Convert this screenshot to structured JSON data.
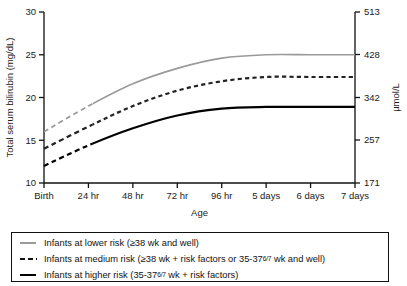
{
  "chart_data": {
    "type": "line",
    "title": "",
    "xlabel": "Age",
    "ylabel": "Total serum bilirubin (mg/dL)",
    "ylabel_right": "µmol/L",
    "grid": false,
    "legend_position": "bottom",
    "categories": [
      "Birth",
      "24 hr",
      "48 hr",
      "72 hr",
      "96 hr",
      "5 days",
      "6 days",
      "7 days"
    ],
    "x": [
      0,
      1,
      2,
      3,
      4,
      5,
      6,
      7
    ],
    "ylim": [
      10,
      30
    ],
    "yticks": [
      10,
      15,
      20,
      25,
      30
    ],
    "ytick_labels": [
      "10",
      "15",
      "20",
      "25",
      "30"
    ],
    "ylim_right": [
      171,
      513
    ],
    "yticks_right": [
      171,
      257,
      342,
      428,
      513
    ],
    "ytick_labels_right": [
      "171",
      "257",
      "342",
      "428",
      "513"
    ],
    "series": [
      {
        "name": "Infants at lower risk (≥38 wk and well)",
        "color": "#9a9a9a",
        "style": "solid",
        "lead_style": "dashed",
        "lead_end_x": 1.1,
        "values": [
          16.0,
          19.0,
          21.6,
          23.4,
          24.6,
          25.0,
          25.0,
          25.0
        ]
      },
      {
        "name": "Infants at medium risk (≥38 wk + risk factors or 35-37 6/7 wk and well)",
        "color": "#222222",
        "style": "dashed",
        "lead_style": "dashed",
        "lead_end_x": 1.1,
        "values": [
          14.0,
          16.6,
          19.0,
          20.8,
          21.9,
          22.4,
          22.4,
          22.4
        ]
      },
      {
        "name": "Infants at higher risk (35-37 6/7 wk + risk factors)",
        "color": "#000000",
        "style": "solid",
        "lead_style": "dashed",
        "lead_end_x": 1.1,
        "values": [
          12.0,
          14.4,
          16.4,
          17.9,
          18.7,
          18.9,
          18.9,
          18.9
        ]
      }
    ]
  },
  "legend": {
    "rows": [
      {
        "key": "lower-risk",
        "text_before": "Infants at lower risk (≥38 wk and well)",
        "text_after": ""
      },
      {
        "key": "medium-risk",
        "text_before": "Infants at medium risk (≥38 wk + risk factors or 35-37",
        "frac": "6/7",
        "text_after": " wk and well)"
      },
      {
        "key": "higher-risk",
        "text_before": "Infants at higher risk (35-37",
        "frac": "6/7",
        "text_after": " wk + risk factors)"
      }
    ]
  }
}
